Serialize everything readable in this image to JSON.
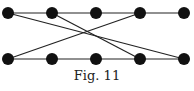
{
  "figure": {
    "caption": "Fig. 11",
    "nodes": [
      {
        "id": "T1",
        "x": 8,
        "y": 13
      },
      {
        "id": "T2",
        "x": 52,
        "y": 13
      },
      {
        "id": "T3",
        "x": 96,
        "y": 13
      },
      {
        "id": "T4",
        "x": 140,
        "y": 13
      },
      {
        "id": "T5",
        "x": 184,
        "y": 13
      },
      {
        "id": "B1",
        "x": 8,
        "y": 59
      },
      {
        "id": "B2",
        "x": 52,
        "y": 59
      },
      {
        "id": "B3",
        "x": 96,
        "y": 59
      },
      {
        "id": "B4",
        "x": 140,
        "y": 59
      },
      {
        "id": "B5",
        "x": 184,
        "y": 59
      }
    ],
    "edges": [
      [
        "T1",
        "T2"
      ],
      [
        "T2",
        "T3"
      ],
      [
        "T3",
        "T4"
      ],
      [
        "T4",
        "T5"
      ],
      [
        "B1",
        "B2"
      ],
      [
        "B2",
        "B3"
      ],
      [
        "B3",
        "B4"
      ],
      [
        "B4",
        "B5"
      ],
      [
        "T1",
        "B5"
      ],
      [
        "T2",
        "B4"
      ],
      [
        "B1",
        "T4"
      ]
    ],
    "node_color": "#111111",
    "edge_color": "#222222"
  }
}
